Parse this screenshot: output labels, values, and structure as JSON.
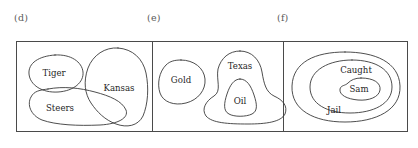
{
  "figure": {
    "panels": [
      {
        "caption": "(d)",
        "relationship": "overlapping sets",
        "sets": [
          {
            "label": "Tiger",
            "label_x": 54,
            "label_y": 73
          },
          {
            "label": "Steers",
            "label_x": 60,
            "label_y": 108
          },
          {
            "label": "Kansas",
            "label_x": 119,
            "label_y": 88
          }
        ]
      },
      {
        "caption": "(e)",
        "relationship": "disjoint set plus nested subset",
        "sets": [
          {
            "label": "Gold",
            "label_x": 181,
            "label_y": 80
          },
          {
            "label": "Texas",
            "label_x": 240,
            "label_y": 66
          },
          {
            "label": "Oil",
            "label_x": 240,
            "label_y": 101
          }
        ]
      },
      {
        "caption": "(f)",
        "relationship": "concentric nested sets",
        "sets": [
          {
            "label": "Jail",
            "label_x": 334,
            "label_y": 110
          },
          {
            "label": "Caught",
            "label_x": 356,
            "label_y": 70
          },
          {
            "label": "Sam",
            "label_x": 359,
            "label_y": 89
          }
        ]
      }
    ]
  },
  "colors": {
    "background": "#ffffff",
    "frame_stroke": "#4a4a4a",
    "curve_stroke": "#3a3a3a",
    "label_text": "#1f1f1f",
    "caption_text": "#5a5a5a"
  }
}
